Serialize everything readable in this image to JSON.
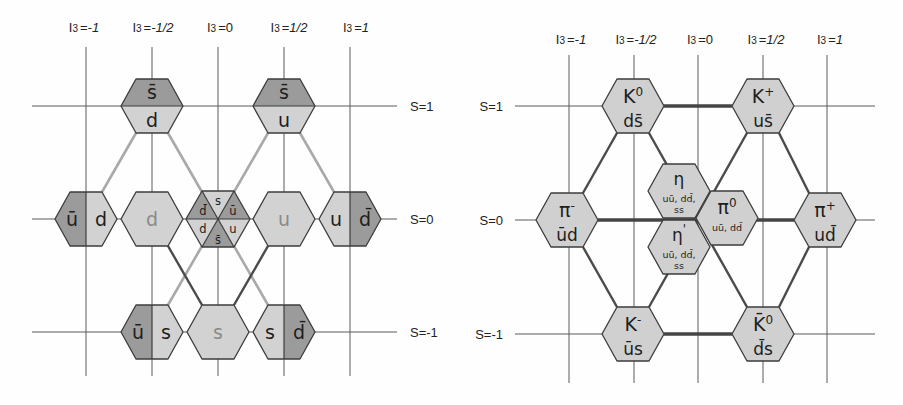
{
  "figure": {
    "left": {
      "i3_labels": [
        {
          "var": "I",
          "sub": "3",
          "eq": "=",
          "val": "-1"
        },
        {
          "var": "I",
          "sub": "3",
          "eq": "=",
          "val": "-1/2"
        },
        {
          "var": "I",
          "sub": "3",
          "eq": "=",
          "val": "0"
        },
        {
          "var": "I",
          "sub": "3",
          "eq": "=",
          "val": "1/2"
        },
        {
          "var": "I",
          "sub": "3",
          "eq": "=",
          "val": "1"
        }
      ],
      "s_labels": [
        "S=1",
        "S=0",
        "S=-1"
      ],
      "quark_hexes": {
        "sbar_d": {
          "upper": "s̄",
          "lower": "d"
        },
        "sbar_u": {
          "upper": "s̄",
          "lower": "u"
        },
        "ubar_d": {
          "left": "ū",
          "right": "d"
        },
        "d": {
          "center": "d"
        },
        "mixed": {
          "top": "s",
          "upper_left": "d̄",
          "upper_right": "ū",
          "lower_left": "d",
          "lower_right": "u",
          "bottom": "s̄"
        },
        "u": {
          "center": "u"
        },
        "u_dbar": {
          "left": "u",
          "right": "d̄"
        },
        "ubar_s": {
          "left": "ū",
          "right": "s"
        },
        "s": {
          "center": "s"
        },
        "s_dbar": {
          "left": "s",
          "right": "d̄"
        }
      }
    },
    "right": {
      "i3_labels": [
        {
          "var": "I",
          "sub": "3",
          "eq": "=",
          "val": "-1"
        },
        {
          "var": "I",
          "sub": "3",
          "eq": "=",
          "val": "-1/2"
        },
        {
          "var": "I",
          "sub": "3",
          "eq": "=",
          "val": "0"
        },
        {
          "var": "I",
          "sub": "3",
          "eq": "=",
          "val": "1/2"
        },
        {
          "var": "I",
          "sub": "3",
          "eq": "=",
          "val": "1"
        }
      ],
      "s_labels": [
        "S=1",
        "S=0",
        "S=-1"
      ],
      "mesons": {
        "K0": {
          "name": "K",
          "sup": "0",
          "quarks": "ds̄"
        },
        "Kplus": {
          "name": "K",
          "sup": "+",
          "quarks": "us̄"
        },
        "piminus": {
          "name": "π",
          "sup": "-",
          "quarks": "ūd"
        },
        "eta": {
          "name": "η",
          "quarks_line1": "uū, dd̄,",
          "quarks_line2": "ss"
        },
        "pi0": {
          "name": "π",
          "sup": "0",
          "quarks": "uū, dd̄"
        },
        "etaprime": {
          "name": "η",
          "sup": "'",
          "quarks_line1": "uū, dd̄,",
          "quarks_line2": "ss"
        },
        "piplus": {
          "name": "π",
          "sup": "+",
          "quarks": "ud̄"
        },
        "Kminus": {
          "name": "K",
          "sup": "-",
          "quarks": "ūs"
        },
        "K0bar": {
          "name": "K̄",
          "sup": "0",
          "quarks": "d̄s"
        }
      }
    },
    "colors": {
      "antiquark_fill": "#9b9b9b",
      "quark_fill": "#d2d2d2",
      "meson_fill": "#d0d0d0",
      "outline": "#3c3c3c",
      "light_link": "#a9a9a9",
      "dark_link": "#4a4a4a",
      "muted_text": "#8a8a8a"
    }
  }
}
